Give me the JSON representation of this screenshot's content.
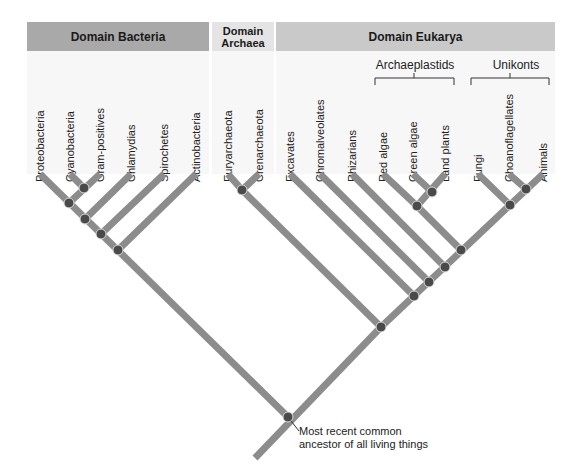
{
  "headers": {
    "bacteria": "Domain Bacteria",
    "archaea_line1": "Domain",
    "archaea_line2": "Archaea",
    "eukarya": "Domain Eukarya"
  },
  "groups": {
    "archaeplastids": "Archaeplastids",
    "unikonts": "Unikonts"
  },
  "leaves": [
    {
      "label": "Proteobacteria",
      "x": 40
    },
    {
      "label": "Cyanobacteria",
      "x": 70
    },
    {
      "label": "Gram-positives",
      "x": 100
    },
    {
      "label": "Chlamydias",
      "x": 131
    },
    {
      "label": "Spirochetes",
      "x": 164
    },
    {
      "label": "Actinobacteria",
      "x": 196
    },
    {
      "label": "Euryarchaeota",
      "x": 228
    },
    {
      "label": "Crenarchaeota",
      "x": 259
    },
    {
      "label": "Excavates",
      "x": 290
    },
    {
      "label": "Chromalveolates",
      "x": 320
    },
    {
      "label": "Rhizarians",
      "x": 352
    },
    {
      "label": "Red algae",
      "x": 383
    },
    {
      "label": "Green algae",
      "x": 413
    },
    {
      "label": "Land plants",
      "x": 445
    },
    {
      "label": "Fungi",
      "x": 478
    },
    {
      "label": "Choanoflagellates",
      "x": 509
    },
    {
      "label": "Animals",
      "x": 543
    }
  ],
  "annotation": {
    "line1": "Most recent common",
    "line2": "ancestor of all living things"
  },
  "colors": {
    "branch": "#8c8c8c",
    "node": "#4a4a4a",
    "bacteria_header": "#a9a9a9",
    "archaea_header": "#e4e4e4",
    "eukarya_header": "#c9c9c9"
  }
}
